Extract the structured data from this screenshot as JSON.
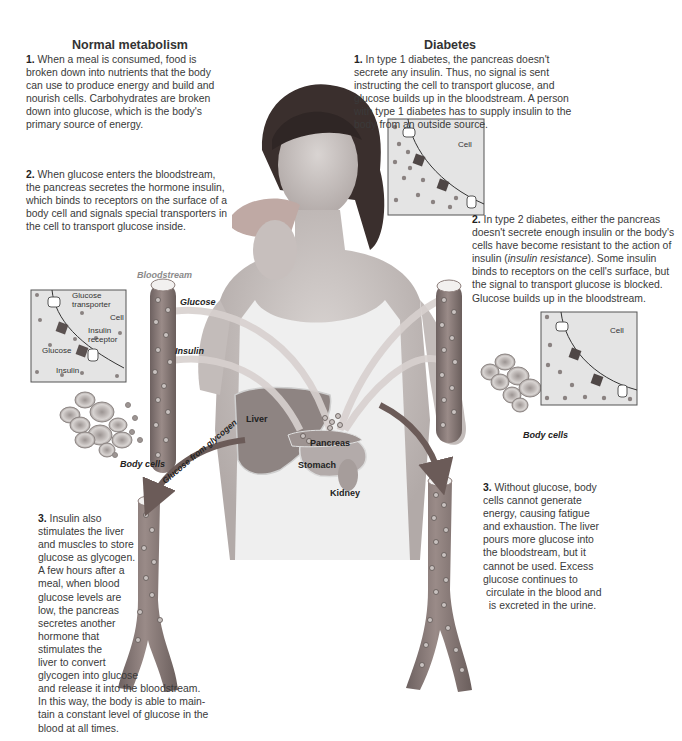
{
  "normal": {
    "heading": "Normal metabolism",
    "step1_num": "1.",
    "step1_text": "When a meal is consumed, food is broken down into nutrients that the body can use to produce energy and build and nourish cells. Carbohydrates are broken down into glucose, which is the body's primary source of energy.",
    "step2_num": "2.",
    "step2_text": "When glucose enters the bloodstream, the pancreas secretes the hormone insulin, which binds to receptors on the surface of a body cell and signals special transporters in the cell to transport glucose inside.",
    "step3_num": "3.",
    "step3_lines": [
      "Insulin also",
      "stimulates the liver",
      "and muscles to store",
      "glucose as glycogen.",
      "A few hours after a",
      "meal, when blood",
      "glucose levels are",
      "low, the pancreas",
      "secretes another",
      "hormone that",
      "stimulates the",
      "liver to convert",
      "glycogen into glucose",
      "and release it into the bloodstream.",
      "In this way, the body is able to main-",
      "tain a constant level of glucose in the",
      "blood at all times."
    ]
  },
  "diabetes": {
    "heading": "Diabetes",
    "step1_num": "1.",
    "step1_text": "In type 1 diabetes, the pancreas doesn't secrete any insulin. Thus, no signal is sent instructing the cell to transport glucose, and glucose builds up in the bloodstream. A person with type 1 diabetes has to supply insulin to the body from an outside source.",
    "step2_num": "2.",
    "step2_pre": "In type 2 diabetes, either the pancreas doesn't secrete enough insulin or the body's cells have become resistant to the action of insulin (",
    "step2_italic": "insulin resistance",
    "step2_post": "). Some insulin binds to receptors on the cell's surface, but the signal to transport glucose is blocked. Glucose builds up in the bloodstream.",
    "step3_num": "3.",
    "step3_lines": [
      "Without glucose, body",
      "cells cannot generate",
      "energy, causing fatigue",
      "and exhaustion. The liver",
      "pours more glucose into",
      "the bloodstream, but it",
      "cannot be used. Excess",
      "glucose continues to",
      " circulate in the blood and",
      "  is excreted in the urine."
    ]
  },
  "labels": {
    "bloodstream": "Bloodstream",
    "glucose": "Glucose",
    "insulin": "Insulin",
    "liver": "Liver",
    "pancreas": "Pancreas",
    "stomach": "Stomach",
    "kidney": "Kidney",
    "body_cells_left": "Body cells",
    "body_cells_right": "Body cells",
    "glucose_from_glycogen": "Glucose from glycogen"
  },
  "inset_normal": {
    "glucose_transporter": "Glucose transporter",
    "glucose_transporter_l1": "Glucose",
    "glucose_transporter_l2": "transporter",
    "cell": "Cell",
    "insulin_receptor_l1": "Insulin",
    "insulin_receptor_l2": "receptor",
    "glucose": "Glucose",
    "insulin": "Insulin"
  },
  "inset_type1": {
    "cell": "Cell"
  },
  "inset_type2": {
    "cell": "Cell"
  },
  "colors": {
    "vessel": "#8e7f7c",
    "vessel_dark": "#6f6260",
    "organ": "#a09694",
    "arrow": "#6b5b58",
    "inset_bg": "#e4e4e4",
    "dot": "#7f7776",
    "text": "#3a3a3a"
  }
}
